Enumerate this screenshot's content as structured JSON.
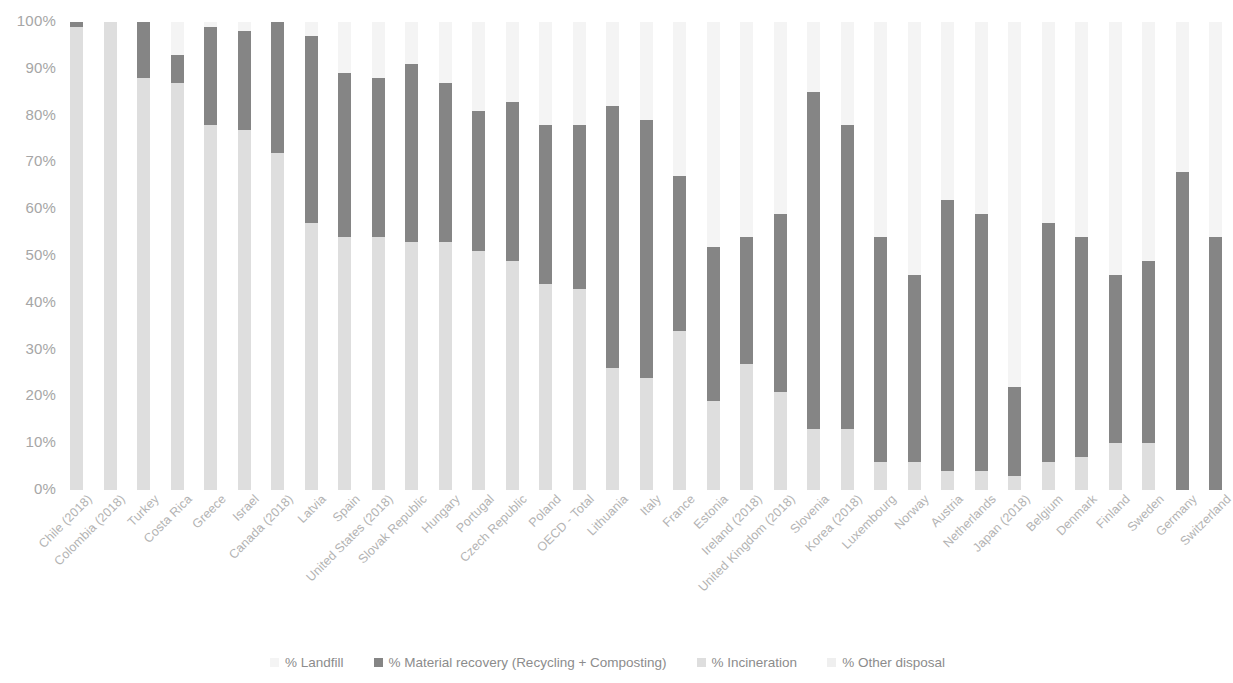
{
  "chart_data": {
    "type": "bar",
    "subtype": "stacked-percentage-column",
    "title": "",
    "subtitle": "",
    "xlabel": "",
    "ylabel": "",
    "ylim": [
      0,
      100
    ],
    "ytick_labels": [
      "100%",
      "90%",
      "80%",
      "70%",
      "60%",
      "50%",
      "40%",
      "30%",
      "20%",
      "10%",
      "0%"
    ],
    "ytick_values": [
      100,
      90,
      80,
      70,
      60,
      50,
      40,
      30,
      20,
      10,
      0
    ],
    "grid": false,
    "legend_position": "bottom",
    "stack_order_top_to_bottom": [
      "% Landfill",
      "% Material recovery (Recycling + Composting)",
      "% Incineration",
      "% Other disposal"
    ],
    "colors": {
      "landfill": "#f4f4f4",
      "material_recovery": "#858585",
      "incineration": "#dedede",
      "other_disposal": "#efefef",
      "axis_text": "#a6a6a6",
      "category_text": "#b3b3b3",
      "legend_text": "#8c8c8c",
      "background": "#ffffff"
    },
    "legend": [
      {
        "label": "% Landfill",
        "color": "#f4f4f4"
      },
      {
        "label": "% Material recovery (Recycling + Composting)",
        "color": "#858585"
      },
      {
        "label": "% Incineration",
        "color": "#dedede"
      },
      {
        "label": "% Other disposal",
        "color": "#efefef"
      }
    ],
    "categories": [
      "Chile (2018)",
      "Colombia (2018)",
      "Turkey",
      "Costa Rica",
      "Greece",
      "Israel",
      "Canada (2018)",
      "Latvia",
      "Spain",
      "United States (2018)",
      "Slovak Republic",
      "Hungary",
      "Portugal",
      "Czech Republic",
      "Poland",
      "OECD - Total",
      "Lithuania",
      "Italy",
      "France",
      "Estonia",
      "Ireland (2018)",
      "United Kingdom (2018)",
      "Slovenia",
      "Korea (2018)",
      "Luxembourg",
      "Norway",
      "Austria",
      "Netherlands",
      "Japan (2018)",
      "Belgium",
      "Denmark",
      "Finland",
      "Sweden",
      "Germany",
      "Switzerland"
    ],
    "series": [
      {
        "name": "% Landfill",
        "values": [
          99,
          100,
          12,
          7,
          1,
          2,
          0,
          3,
          11,
          12,
          9,
          13,
          19,
          17,
          22,
          22,
          18,
          21,
          33,
          28,
          46,
          36,
          15,
          22,
          46,
          38,
          38,
          41,
          78,
          43,
          46,
          55,
          51,
          32,
          46
        ]
      },
      {
        "name": "% Material recovery (Recycling + Composting)",
        "values": [
          1,
          0,
          76,
          6,
          21,
          21,
          28,
          40,
          35,
          34,
          38,
          34,
          30,
          34,
          34,
          35,
          56,
          55,
          33,
          33,
          27,
          38,
          72,
          65,
          48,
          40,
          58,
          55,
          19,
          51,
          47,
          35,
          39,
          68,
          54
        ]
      },
      {
        "name": "% Incineration",
        "values": [
          0,
          0,
          12,
          87,
          78,
          77,
          72,
          57,
          54,
          54,
          53,
          53,
          51,
          49,
          44,
          43,
          26,
          24,
          34,
          39,
          27,
          26,
          13,
          13,
          6,
          22,
          4,
          4,
          3,
          6,
          7,
          10,
          10,
          0,
          0
        ]
      },
      {
        "name": "% Other disposal",
        "values": [
          0,
          0,
          0,
          0,
          0,
          0,
          0,
          0,
          0,
          0,
          0,
          0,
          0,
          0,
          0,
          0,
          0,
          0,
          0,
          0,
          0,
          0,
          0,
          0,
          0,
          0,
          0,
          0,
          0,
          0,
          0,
          0,
          0,
          0,
          0
        ]
      }
    ],
    "bar_boundaries_percent_top_down": [
      {
        "category": "Chile (2018)",
        "landfill_top": 100,
        "recovery_top": 100,
        "recovery_bottom": 99,
        "incineration_bottom": 0
      },
      {
        "category": "Colombia (2018)",
        "landfill_top": 100,
        "recovery_top": 100,
        "recovery_bottom": 100,
        "incineration_bottom": 0
      },
      {
        "category": "Turkey",
        "landfill_top": 100,
        "recovery_top": 100,
        "recovery_bottom": 88,
        "incineration_bottom": 0
      },
      {
        "category": "Costa Rica",
        "landfill_top": 100,
        "recovery_top": 93,
        "recovery_bottom": 87,
        "incineration_bottom": 0
      },
      {
        "category": "Greece",
        "landfill_top": 100,
        "recovery_top": 99,
        "recovery_bottom": 78,
        "incineration_bottom": 0
      },
      {
        "category": "Israel",
        "landfill_top": 100,
        "recovery_top": 98,
        "recovery_bottom": 77,
        "incineration_bottom": 0
      },
      {
        "category": "Canada (2018)",
        "landfill_top": 100,
        "recovery_top": 100,
        "recovery_bottom": 72,
        "incineration_bottom": 0
      },
      {
        "category": "Latvia",
        "landfill_top": 100,
        "recovery_top": 97,
        "recovery_bottom": 57,
        "incineration_bottom": 0
      },
      {
        "category": "Spain",
        "landfill_top": 100,
        "recovery_top": 89,
        "recovery_bottom": 54,
        "incineration_bottom": 0
      },
      {
        "category": "United States (2018)",
        "landfill_top": 100,
        "recovery_top": 88,
        "recovery_bottom": 54,
        "incineration_bottom": 0
      },
      {
        "category": "Slovak Republic",
        "landfill_top": 100,
        "recovery_top": 91,
        "recovery_bottom": 53,
        "incineration_bottom": 0
      },
      {
        "category": "Hungary",
        "landfill_top": 100,
        "recovery_top": 87,
        "recovery_bottom": 53,
        "incineration_bottom": 0
      },
      {
        "category": "Portugal",
        "landfill_top": 100,
        "recovery_top": 81,
        "recovery_bottom": 51,
        "incineration_bottom": 0
      },
      {
        "category": "Czech Republic",
        "landfill_top": 100,
        "recovery_top": 83,
        "recovery_bottom": 49,
        "incineration_bottom": 0
      },
      {
        "category": "Poland",
        "landfill_top": 100,
        "recovery_top": 78,
        "recovery_bottom": 44,
        "incineration_bottom": 0
      },
      {
        "category": "OECD - Total",
        "landfill_top": 100,
        "recovery_top": 78,
        "recovery_bottom": 43,
        "incineration_bottom": 0
      },
      {
        "category": "Lithuania",
        "landfill_top": 100,
        "recovery_top": 82,
        "recovery_bottom": 26,
        "incineration_bottom": 0
      },
      {
        "category": "Italy",
        "landfill_top": 100,
        "recovery_top": 79,
        "recovery_bottom": 24,
        "incineration_bottom": 0
      },
      {
        "category": "France",
        "landfill_top": 100,
        "recovery_top": 67,
        "recovery_bottom": 34,
        "incineration_bottom": 0
      },
      {
        "category": "Estonia",
        "landfill_top": 100,
        "recovery_top": 52,
        "recovery_bottom": 19,
        "incineration_bottom": 0
      },
      {
        "category": "Ireland (2018)",
        "landfill_top": 100,
        "recovery_top": 54,
        "recovery_bottom": 27,
        "incineration_bottom": 0
      },
      {
        "category": "United Kingdom (2018)",
        "landfill_top": 100,
        "recovery_top": 59,
        "recovery_bottom": 21,
        "incineration_bottom": 0
      },
      {
        "category": "Slovenia",
        "landfill_top": 100,
        "recovery_top": 85,
        "recovery_bottom": 13,
        "incineration_bottom": 0
      },
      {
        "category": "Korea (2018)",
        "landfill_top": 100,
        "recovery_top": 78,
        "recovery_bottom": 13,
        "incineration_bottom": 0
      },
      {
        "category": "Luxembourg",
        "landfill_top": 100,
        "recovery_top": 54,
        "recovery_bottom": 6,
        "incineration_bottom": 0
      },
      {
        "category": "Norway",
        "landfill_top": 100,
        "recovery_top": 46,
        "recovery_bottom": 6,
        "incineration_bottom": 0
      },
      {
        "category": "Austria",
        "landfill_top": 100,
        "recovery_top": 62,
        "recovery_bottom": 4,
        "incineration_bottom": 0
      },
      {
        "category": "Netherlands",
        "landfill_top": 100,
        "recovery_top": 59,
        "recovery_bottom": 4,
        "incineration_bottom": 0
      },
      {
        "category": "Japan (2018)",
        "landfill_top": 100,
        "recovery_top": 22,
        "recovery_bottom": 3,
        "incineration_bottom": 0
      },
      {
        "category": "Belgium",
        "landfill_top": 100,
        "recovery_top": 57,
        "recovery_bottom": 6,
        "incineration_bottom": 0
      },
      {
        "category": "Denmark",
        "landfill_top": 100,
        "recovery_top": 54,
        "recovery_bottom": 7,
        "incineration_bottom": 0
      },
      {
        "category": "Finland",
        "landfill_top": 100,
        "recovery_top": 46,
        "recovery_bottom": 10,
        "incineration_bottom": 0
      },
      {
        "category": "Sweden",
        "landfill_top": 100,
        "recovery_top": 49,
        "recovery_bottom": 10,
        "incineration_bottom": 0
      },
      {
        "category": "Germany",
        "landfill_top": 100,
        "recovery_top": 68,
        "recovery_bottom": 0,
        "incineration_bottom": 0
      },
      {
        "category": "Switzerland",
        "landfill_top": 100,
        "recovery_top": 54,
        "recovery_bottom": 0,
        "incineration_bottom": 0
      }
    ]
  }
}
